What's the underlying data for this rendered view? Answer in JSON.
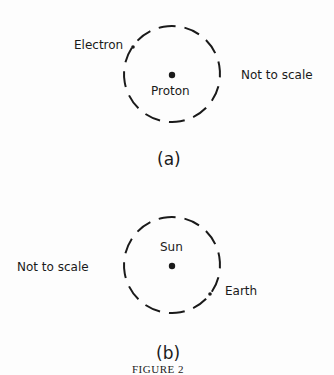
{
  "figure": {
    "caption": "FIGURE 2",
    "panels": [
      {
        "id": "a",
        "label": "(a)",
        "center_label": "Proton",
        "orbiter_label": "Electron",
        "note": "Not to scale"
      },
      {
        "id": "b",
        "label": "(b)",
        "center_label": "Sun",
        "orbiter_label": "Earth",
        "note": "Not to scale"
      }
    ]
  }
}
